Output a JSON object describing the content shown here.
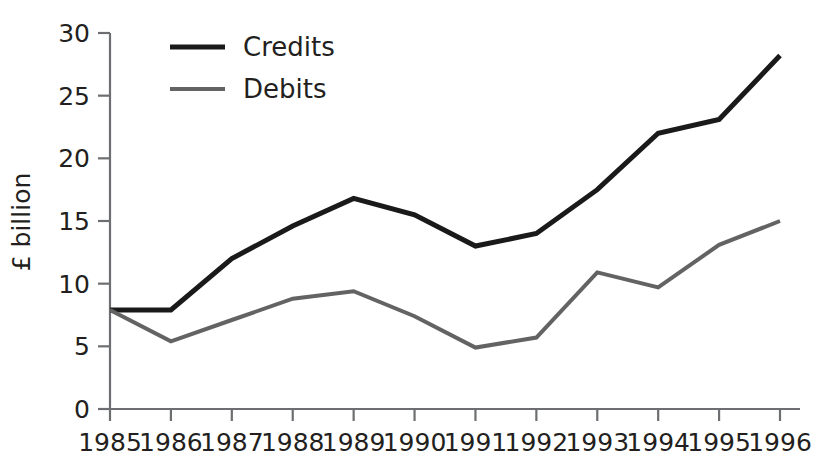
{
  "chart_data": {
    "type": "line",
    "title": "",
    "subtitle": "",
    "xlabel": "",
    "ylabel": "£ billion",
    "x": [
      "1985",
      "1986",
      "1987",
      "1988",
      "1989",
      "1990",
      "1991",
      "1992",
      "1993",
      "1994",
      "1995",
      "1996"
    ],
    "categories": [
      "1985",
      "1986",
      "1987",
      "1988",
      "1989",
      "1990",
      "1991",
      "1992",
      "1993",
      "1994",
      "1995",
      "1996"
    ],
    "series": [
      {
        "name": "Credits",
        "color": "#1a1a1a",
        "line_width": 5,
        "values": [
          7.9,
          7.9,
          12.0,
          14.6,
          16.8,
          15.5,
          13.0,
          14.0,
          17.5,
          22.0,
          23.1,
          28.2
        ]
      },
      {
        "name": "Debits",
        "color": "#636363",
        "line_width": 4,
        "values": [
          7.9,
          5.4,
          7.1,
          8.8,
          9.4,
          7.4,
          4.9,
          5.7,
          10.9,
          9.7,
          13.1,
          15.0
        ]
      }
    ],
    "ylim": [
      0,
      30
    ],
    "yticks": [
      0,
      5,
      10,
      15,
      20,
      25,
      30
    ],
    "ytick_labels": [
      "0",
      "5",
      "10",
      "15",
      "20",
      "25",
      "30"
    ],
    "xtick_labels": [
      "1985",
      "1986",
      "1987",
      "1988",
      "1989",
      "1990",
      "1991",
      "1992",
      "1993",
      "1994",
      "1995",
      "1996"
    ],
    "grid": false,
    "legend": {
      "position": "top-left-inside",
      "entries": [
        {
          "label": "Credits",
          "color": "#1a1a1a"
        },
        {
          "label": "Debits",
          "color": "#636363"
        }
      ]
    },
    "axis_color": "#6d6e71",
    "text_color": "#231f20",
    "background": "#ffffff"
  }
}
